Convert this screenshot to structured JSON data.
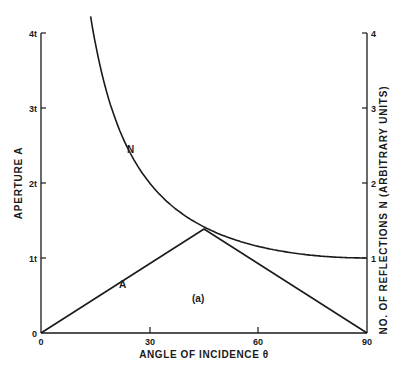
{
  "chart_data": {
    "type": "line",
    "title": "",
    "xlabel": "ANGLE OF INCIDENCE θ",
    "ylabel": "APERTURE A",
    "y2label": "NO. OF REFLECTIONS N  (ARBITRARY UNITS)",
    "xlim": [
      0,
      90
    ],
    "ylim": [
      0,
      4
    ],
    "y2lim": [
      0,
      4
    ],
    "x_ticks": [
      "0",
      "30",
      "60",
      "90"
    ],
    "y_ticks": [
      "0",
      "1t",
      "2t",
      "3t",
      "4t"
    ],
    "y2_ticks": [
      "1",
      "2",
      "3",
      "4"
    ],
    "annotation": "(a)",
    "grid": false,
    "series": [
      {
        "name": "A",
        "axis": "left",
        "x": [
          0,
          15,
          30,
          45,
          60,
          75,
          90
        ],
        "values": [
          0,
          0.47,
          0.94,
          1.41,
          0.94,
          0.47,
          0
        ]
      },
      {
        "name": "N",
        "axis": "right",
        "x": [
          14.5,
          20,
          30,
          40,
          45,
          60,
          75,
          90
        ],
        "values": [
          4.0,
          2.92,
          2.0,
          1.56,
          1.41,
          1.15,
          1.04,
          1.0
        ]
      }
    ]
  }
}
